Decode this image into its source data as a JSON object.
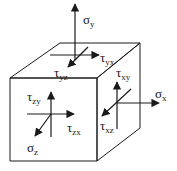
{
  "diagram": {
    "colors": {
      "stroke": "#1a1a1a",
      "background": "#ffffff"
    },
    "labels": {
      "sigma_y": {
        "symbol": "σ",
        "sub": "y"
      },
      "tau_yx": {
        "symbol": "τ",
        "sub": "yx"
      },
      "tau_yz": {
        "symbol": "τ",
        "sub": "yz"
      },
      "tau_zy": {
        "symbol": "τ",
        "sub": "zy"
      },
      "tau_zx": {
        "symbol": "τ",
        "sub": "zx"
      },
      "sigma_z": {
        "symbol": "σ",
        "sub": "z"
      },
      "tau_xy": {
        "symbol": "τ",
        "sub": "xy"
      },
      "sigma_x": {
        "symbol": "σ",
        "sub": "x"
      },
      "tau_xz": {
        "symbol": "τ",
        "sub": "xz"
      }
    },
    "faces": [
      "top (y)",
      "front (z)",
      "right (x)"
    ]
  }
}
